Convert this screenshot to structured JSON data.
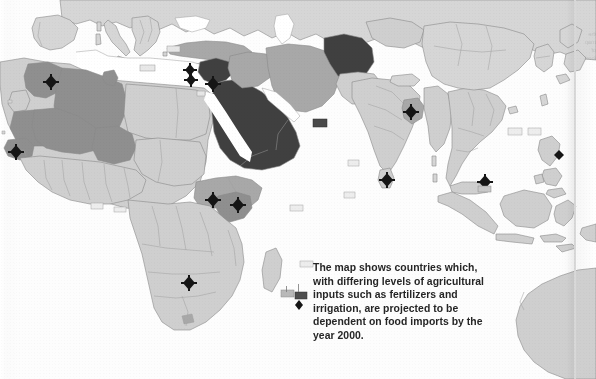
{
  "document": {
    "kind": "scanned-atlas-page",
    "title": "World map of projected food import dependency"
  },
  "caption": {
    "lines": [
      "The map shows countries which,",
      "with differing levels of agricultural",
      "inputs such as fertilizers and",
      "irrigation, are projected to be",
      "dependent on food imports by the",
      "year 2000."
    ],
    "full_text": "The map shows countries which, with differing levels of agricultural inputs such as fertilizers and irrigation, are projected to be dependent on food imports by the year 2000."
  },
  "legend_shades": {
    "sea": "#ffffff",
    "land_base": "#d9d9d9",
    "level_low": "#cfcfcf",
    "level_medium": "#a8a8a8",
    "level_high": "#8f8f8f",
    "level_highest": "#3f3f3f",
    "border_line": "#8a8a8a",
    "marker": "#151515",
    "caption_text": "#262626"
  },
  "map": {
    "projection_note": "cropped world map centred on Africa, Middle East and South/East Asia",
    "regions": [
      {
        "name": "europe-mediterranean",
        "shade": "level_low"
      },
      {
        "name": "morocco",
        "shade": "level_high"
      },
      {
        "name": "algeria",
        "shade": "level_high"
      },
      {
        "name": "mali",
        "shade": "level_high"
      },
      {
        "name": "niger",
        "shade": "level_high"
      },
      {
        "name": "senegal",
        "shade": "level_high"
      },
      {
        "name": "libya-egypt",
        "shade": "level_low"
      },
      {
        "name": "turkey",
        "shade": "level_medium"
      },
      {
        "name": "iraq",
        "shade": "level_medium"
      },
      {
        "name": "iran",
        "shade": "level_medium"
      },
      {
        "name": "saudi-arabia-peninsula",
        "shade": "level_highest"
      },
      {
        "name": "afghanistan",
        "shade": "level_highest"
      },
      {
        "name": "syria-lebanon-israel",
        "shade": "level_highest"
      },
      {
        "name": "ethiopia-somalia",
        "shade": "level_medium"
      },
      {
        "name": "kenya",
        "shade": "level_high"
      },
      {
        "name": "sub-saharan-africa",
        "shade": "level_low"
      },
      {
        "name": "india",
        "shade": "level_low"
      },
      {
        "name": "bangladesh",
        "shade": "level_medium"
      },
      {
        "name": "southeast-asia",
        "shade": "level_low"
      },
      {
        "name": "indonesia-malaysia",
        "shade": "level_low"
      },
      {
        "name": "china-east-asia",
        "shade": "level_low"
      },
      {
        "name": "australia-northwest",
        "shade": "level_low"
      }
    ],
    "markers": [
      {
        "name": "marker-morocco",
        "x": 51,
        "y": 82
      },
      {
        "name": "marker-senegal",
        "x": 16,
        "y": 152
      },
      {
        "name": "marker-cyprus",
        "x": 190,
        "y": 70
      },
      {
        "name": "marker-lebanon",
        "x": 191,
        "y": 80
      },
      {
        "name": "marker-israel-jordan",
        "x": 213,
        "y": 84
      },
      {
        "name": "marker-ethiopia",
        "x": 213,
        "y": 200
      },
      {
        "name": "marker-kenya",
        "x": 238,
        "y": 205
      },
      {
        "name": "marker-zimbabwe",
        "x": 189,
        "y": 283
      },
      {
        "name": "marker-bangladesh",
        "x": 411,
        "y": 112
      },
      {
        "name": "marker-sri-lanka",
        "x": 387,
        "y": 180
      },
      {
        "name": "marker-singapore",
        "x": 485,
        "y": 182
      },
      {
        "name": "marker-philippines",
        "x": 559,
        "y": 155
      }
    ],
    "label_chips": [
      {
        "name": "chip-mediterranean",
        "x": 140,
        "y": 65,
        "w": 15,
        "h": 6,
        "tone": "light"
      },
      {
        "name": "chip-north-africa",
        "x": 167,
        "y": 46,
        "w": 13,
        "h": 6,
        "tone": "light"
      },
      {
        "name": "chip-libya",
        "x": 197,
        "y": 91,
        "w": 8,
        "h": 5,
        "tone": "light"
      },
      {
        "name": "chip-gulf-of-oman",
        "x": 313,
        "y": 119,
        "w": 14,
        "h": 8,
        "tone": "dark"
      },
      {
        "name": "chip-red-sea",
        "x": 344,
        "y": 192,
        "w": 11,
        "h": 6,
        "tone": "light"
      },
      {
        "name": "chip-indian-ocean",
        "x": 290,
        "y": 205,
        "w": 13,
        "h": 6,
        "tone": "light"
      },
      {
        "name": "chip-atlantic",
        "x": 91,
        "y": 203,
        "w": 12,
        "h": 6,
        "tone": "light"
      },
      {
        "name": "chip-gulf-of-guinea",
        "x": 114,
        "y": 207,
        "w": 12,
        "h": 5,
        "tone": "light"
      },
      {
        "name": "chip-madagascar",
        "x": 300,
        "y": 261,
        "w": 13,
        "h": 6,
        "tone": "light"
      },
      {
        "name": "chip-mozambique",
        "x": 281,
        "y": 290,
        "w": 13,
        "h": 7,
        "tone": "light"
      },
      {
        "name": "chip-caption-left",
        "x": 295,
        "y": 292,
        "w": 12,
        "h": 7,
        "tone": "dark"
      },
      {
        "name": "chip-south-china-sea",
        "x": 478,
        "y": 186,
        "w": 13,
        "h": 6,
        "tone": "light"
      },
      {
        "name": "chip-east-china-sea",
        "x": 508,
        "y": 128,
        "w": 14,
        "h": 7,
        "tone": "light"
      },
      {
        "name": "chip-yellow-sea",
        "x": 528,
        "y": 128,
        "w": 13,
        "h": 7,
        "tone": "light"
      },
      {
        "name": "chip-arabian-sea",
        "x": 348,
        "y": 160,
        "w": 11,
        "h": 6,
        "tone": "light"
      }
    ]
  },
  "bleed_through": {
    "lines": [
      "the",
      "map",
      "of",
      "food"
    ]
  }
}
